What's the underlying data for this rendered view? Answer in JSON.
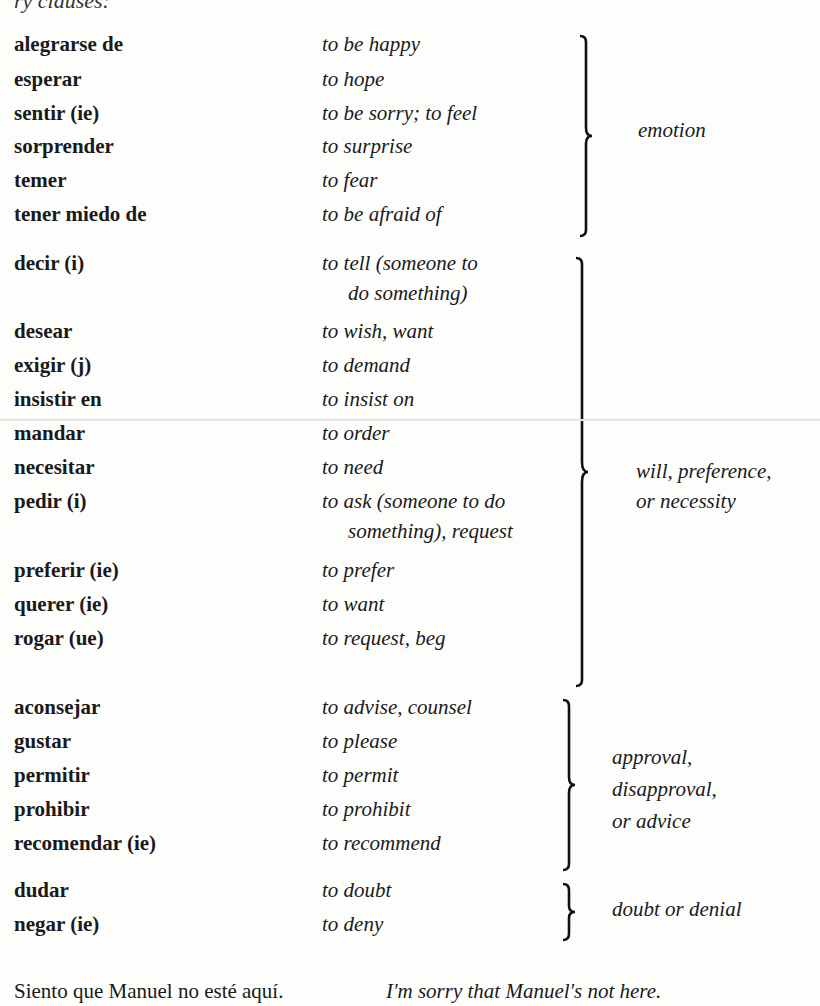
{
  "header_fragment": "ry clauses:",
  "groups": [
    {
      "category": "emotion",
      "verbs": [
        {
          "spanish": "alegrarse de",
          "english": "to be happy"
        },
        {
          "spanish": "esperar",
          "english": "to hope"
        },
        {
          "spanish": "sentir (ie)",
          "english": "to be sorry; to feel"
        },
        {
          "spanish": "sorprender",
          "english": "to surprise"
        },
        {
          "spanish": "temer",
          "english": "to fear"
        },
        {
          "spanish": "tener miedo de",
          "english": "to be afraid of"
        }
      ]
    },
    {
      "category_line1": "will, preference,",
      "category_line2": "or necessity",
      "verbs": [
        {
          "spanish": "decir (i)",
          "english": "to tell (someone to",
          "english_cont": "do something)"
        },
        {
          "spanish": "desear",
          "english": "to wish, want"
        },
        {
          "spanish": "exigir (j)",
          "english": "to demand"
        },
        {
          "spanish": "insistir en",
          "english": "to insist on"
        },
        {
          "spanish": "mandar",
          "english": "to order"
        },
        {
          "spanish": "necesitar",
          "english": "to need"
        },
        {
          "spanish": "pedir (i)",
          "english": "to ask (someone to do",
          "english_cont": "something), request"
        },
        {
          "spanish": "preferir (ie)",
          "english": "to prefer"
        },
        {
          "spanish": "querer (ie)",
          "english": "to want"
        },
        {
          "spanish": "rogar (ue)",
          "english": "to request, beg"
        }
      ]
    },
    {
      "category_line1": "approval,",
      "category_line2": "disapproval,",
      "category_line3": "or advice",
      "verbs": [
        {
          "spanish": "aconsejar",
          "english": "to advise, counsel"
        },
        {
          "spanish": "gustar",
          "english": "to please"
        },
        {
          "spanish": "permitir",
          "english": "to permit"
        },
        {
          "spanish": "prohibir",
          "english": "to prohibit"
        },
        {
          "spanish": "recomendar (ie)",
          "english": "to recommend"
        }
      ]
    },
    {
      "category": "doubt or denial",
      "verbs": [
        {
          "spanish": "dudar",
          "english": "to doubt"
        },
        {
          "spanish": "negar (ie)",
          "english": "to deny"
        }
      ]
    }
  ],
  "example": {
    "spanish": "Siento que Manuel no esté aquí.",
    "english": "I'm sorry that Manuel's not here."
  }
}
